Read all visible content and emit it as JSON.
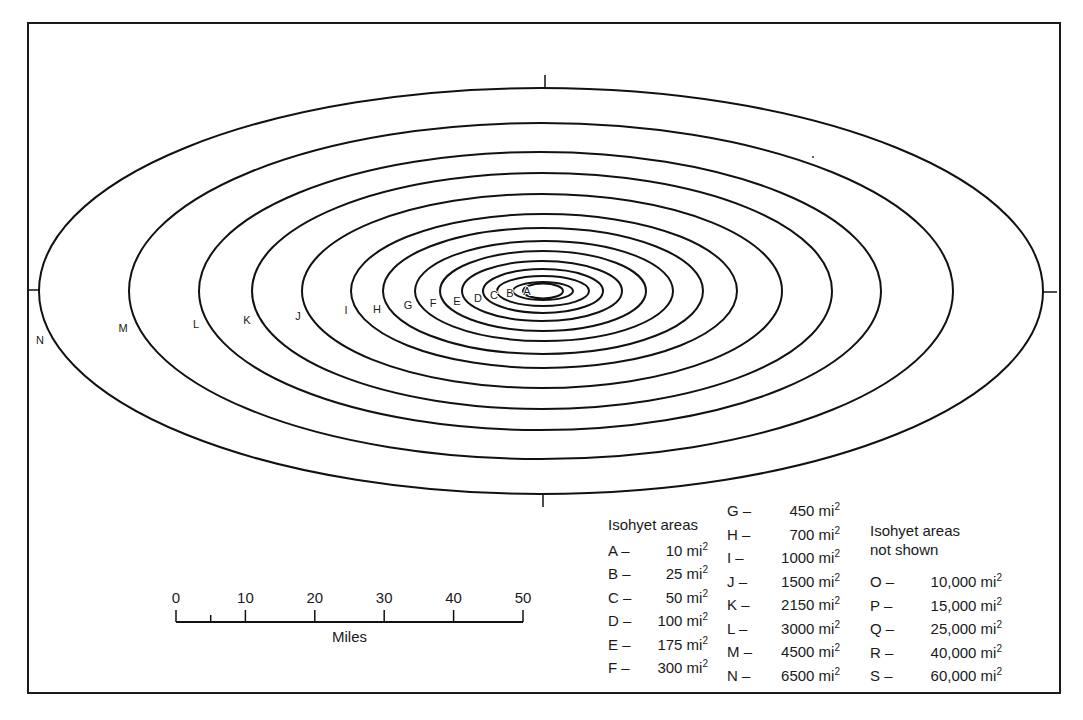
{
  "figure": {
    "frame": {
      "x": 28,
      "y": 23,
      "width": 1032,
      "height": 670
    },
    "center": {
      "x": 542,
      "y": 291
    },
    "isohyets": [
      {
        "label": "A",
        "rx": 20,
        "ry": 7.5,
        "cx": 543,
        "lx": 527,
        "ly": 295
      },
      {
        "label": "B",
        "rx": 30,
        "ry": 9,
        "cx": 543,
        "lx": 510,
        "ly": 297
      },
      {
        "label": "C",
        "rx": 46,
        "ry": 15,
        "cx": 543,
        "lx": 494,
        "ly": 299
      },
      {
        "label": "D",
        "rx": 60,
        "ry": 22,
        "cx": 543,
        "lx": 478,
        "ly": 302
      },
      {
        "label": "E",
        "rx": 80,
        "ry": 30,
        "cx": 542,
        "lx": 457,
        "ly": 305
      },
      {
        "label": "F",
        "rx": 103,
        "ry": 40,
        "cx": 543,
        "lx": 433,
        "ly": 307
      },
      {
        "label": "G",
        "rx": 129,
        "ry": 50,
        "cx": 544,
        "lx": 408,
        "ly": 309
      },
      {
        "label": "H",
        "rx": 160,
        "ry": 63,
        "cx": 543,
        "lx": 377,
        "ly": 313
      },
      {
        "label": "I",
        "rx": 193,
        "ry": 77,
        "cx": 544,
        "lx": 346,
        "ly": 314
      },
      {
        "label": "J",
        "rx": 240,
        "ry": 97,
        "cx": 542,
        "lx": 298,
        "ly": 320
      },
      {
        "label": "K",
        "rx": 290,
        "ry": 118,
        "cx": 542,
        "lx": 247,
        "ly": 324
      },
      {
        "label": "L",
        "rx": 341,
        "ry": 139,
        "cx": 540,
        "lx": 196,
        "ly": 328
      },
      {
        "label": "M",
        "rx": 412,
        "ry": 168,
        "cx": 541,
        "lx": 123,
        "ly": 332
      },
      {
        "label": "N",
        "rx": 502,
        "ry": 203,
        "cx": 541,
        "lx": 40,
        "ly": 344
      }
    ],
    "ticks": [
      {
        "name": "top-axis-tick",
        "x1": 545,
        "y1": 75,
        "x2": 545,
        "y2": 88
      },
      {
        "name": "bottom-axis-tick",
        "x1": 543,
        "y1": 494,
        "x2": 543,
        "y2": 507
      },
      {
        "name": "left-axis-tick",
        "x1": 28,
        "y1": 290,
        "x2": 39,
        "y2": 290
      },
      {
        "name": "right-axis-tick",
        "x1": 1043,
        "y1": 292,
        "x2": 1057,
        "y2": 292
      }
    ]
  },
  "scale_bar": {
    "x0": 176,
    "x1": 523,
    "y": 622,
    "tick_labels": [
      "0",
      "10",
      "20",
      "30",
      "40",
      "50"
    ],
    "minor_tick_at": 5,
    "unit_label": "Miles"
  },
  "legend": {
    "shown_title": "Isohyet areas",
    "shown_col1": [
      {
        "key": "A –",
        "value": "10 mi",
        "sup": "2"
      },
      {
        "key": "B –",
        "value": "25 mi",
        "sup": "2"
      },
      {
        "key": "C –",
        "value": "50 mi",
        "sup": "2"
      },
      {
        "key": "D –",
        "value": "100 mi",
        "sup": "2"
      },
      {
        "key": "E –",
        "value": "175 mi",
        "sup": "2"
      },
      {
        "key": "F –",
        "value": "300 mi",
        "sup": "2"
      }
    ],
    "shown_col2": [
      {
        "key": "G –",
        "value": "450 mi",
        "sup": "2"
      },
      {
        "key": "H –",
        "value": "700 mi",
        "sup": "2"
      },
      {
        "key": "I –",
        "value": "1000 mi",
        "sup": "2"
      },
      {
        "key": "J –",
        "value": "1500 mi",
        "sup": "2"
      },
      {
        "key": "K –",
        "value": "2150 mi",
        "sup": "2"
      },
      {
        "key": "L –",
        "value": "3000 mi",
        "sup": "2"
      },
      {
        "key": "M –",
        "value": "4500 mi",
        "sup": "2"
      },
      {
        "key": "N –",
        "value": "6500 mi",
        "sup": "2"
      }
    ],
    "not_shown_title_line1": "Isohyet areas",
    "not_shown_title_line2": "not shown",
    "not_shown": [
      {
        "key": "O –",
        "value": "10,000 mi",
        "sup": "2"
      },
      {
        "key": "P –",
        "value": "15,000 mi",
        "sup": "2"
      },
      {
        "key": "Q –",
        "value": "25,000 mi",
        "sup": "2"
      },
      {
        "key": "R –",
        "value": "40,000 mi",
        "sup": "2"
      },
      {
        "key": "S –",
        "value": "60,000 mi",
        "sup": "2"
      }
    ]
  }
}
